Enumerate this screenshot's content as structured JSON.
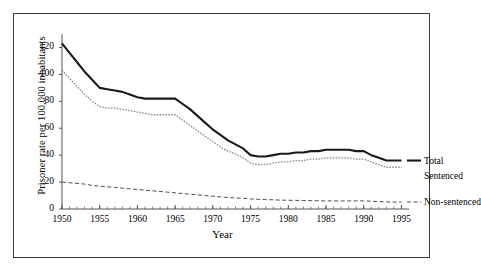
{
  "chart_data": {
    "type": "line",
    "title": "",
    "xlabel": "Year",
    "ylabel": "Prisoner rate per 100,000 inhabitants",
    "xlim": [
      1950,
      1996
    ],
    "ylim": [
      0,
      130
    ],
    "yticks": [
      0,
      20,
      40,
      60,
      80,
      100,
      120
    ],
    "xticks": [
      1950,
      1955,
      1960,
      1965,
      1970,
      1975,
      1980,
      1985,
      1990,
      1995
    ],
    "xtick_labels": [
      "1950",
      "1955",
      "1960",
      "1965",
      "1970",
      "1975",
      "1980",
      "1985",
      "1990",
      "1995"
    ],
    "ytick_labels": [
      "0",
      "20",
      "40",
      "60",
      "80",
      "100",
      "120"
    ],
    "minor_xticks_interval": 1,
    "grid": false,
    "legend_position": "right-inline",
    "x": [
      1950,
      1951,
      1952,
      1953,
      1954,
      1955,
      1956,
      1957,
      1958,
      1959,
      1960,
      1961,
      1962,
      1963,
      1964,
      1965,
      1966,
      1967,
      1968,
      1969,
      1970,
      1971,
      1972,
      1973,
      1974,
      1975,
      1976,
      1977,
      1978,
      1979,
      1980,
      1981,
      1982,
      1983,
      1984,
      1985,
      1986,
      1987,
      1988,
      1989,
      1990,
      1991,
      1992,
      1993,
      1994,
      1995
    ],
    "series": [
      {
        "name": "Total",
        "style": "solid-thick",
        "color": "#1a1a1a",
        "values": [
          123,
          116,
          109,
          102,
          96,
          90,
          89,
          88,
          87,
          85,
          83,
          82,
          82,
          82,
          82,
          82,
          78,
          74,
          69,
          64,
          59,
          55,
          51,
          48,
          45,
          40,
          39,
          39,
          40,
          41,
          41,
          42,
          42,
          43,
          43,
          44,
          44,
          44,
          44,
          43,
          43,
          40,
          38,
          36,
          36,
          36
        ]
      },
      {
        "name": "Sentenced",
        "style": "dotted",
        "color": "#8c8c8c",
        "values": [
          103,
          97,
          91,
          85,
          80,
          76,
          75,
          75,
          74,
          73,
          72,
          71,
          70,
          70,
          70,
          70,
          66,
          62,
          58,
          54,
          50,
          46,
          43,
          41,
          38,
          34,
          33,
          33,
          34,
          35,
          35,
          36,
          36,
          37,
          37,
          38,
          38,
          38,
          38,
          37,
          37,
          35,
          33,
          31,
          31,
          31
        ]
      },
      {
        "name": "Non-sentenced",
        "style": "dashed",
        "color": "#4d4d4d",
        "values": [
          20,
          19.5,
          19,
          18.5,
          17.5,
          17,
          16.5,
          16,
          15.5,
          15,
          14.5,
          14,
          13.5,
          13,
          12.5,
          12,
          11.5,
          11,
          10.5,
          10,
          9.5,
          9,
          8.5,
          8.2,
          8,
          7.5,
          7.2,
          7,
          6.8,
          6.6,
          6.5,
          6.4,
          6.3,
          6.2,
          6.1,
          6,
          6,
          6,
          6,
          6,
          6,
          5.8,
          5.5,
          5.3,
          5.2,
          5.2
        ]
      }
    ],
    "legend": [
      {
        "label": "Total"
      },
      {
        "label": "Sentenced"
      },
      {
        "label": "Non-sentenced"
      }
    ]
  }
}
